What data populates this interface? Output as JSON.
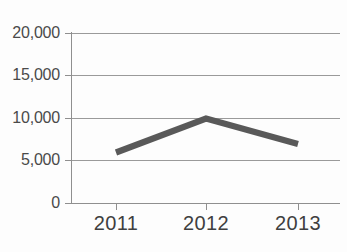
{
  "chart_data": {
    "type": "line",
    "title": "",
    "subtitle": "",
    "xlabel": "",
    "ylabel": "",
    "categories": [
      "2011",
      "2012",
      "2013"
    ],
    "values": [
      6000,
      10000,
      7000
    ],
    "series": [
      {
        "name": "",
        "values": [
          6000,
          10000,
          7000
        ]
      }
    ],
    "ylim": [
      0,
      20000
    ],
    "y_ticks": [
      0,
      5000,
      10000,
      15000,
      20000
    ],
    "y_tick_labels": [
      "0",
      "5,000",
      "10,000",
      "15,000",
      "20,000"
    ],
    "x_tick_labels": [
      "2011",
      "2012",
      "2013"
    ],
    "grid": true,
    "grid_axis": "y",
    "legend": false,
    "legend_position": "none",
    "annotations": [],
    "colors": {
      "series_line": "#595959",
      "gridline": "#9a9a9a",
      "axis": "#8f8f8f",
      "tick_text": "#3f3f3f",
      "background": "#fdfdfd"
    }
  },
  "axis_labels": {
    "y": {
      "t20000": "20,000",
      "t15000": "15,000",
      "t10000": "10,000",
      "t5000": "5,000",
      "t0": "0"
    },
    "x": {
      "c2011": "2011",
      "c2012": "2012",
      "c2013": "2013"
    }
  }
}
